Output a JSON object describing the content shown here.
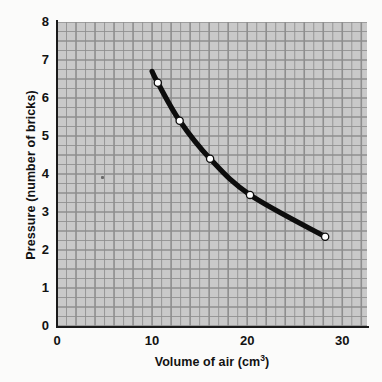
{
  "chart_data": {
    "type": "line",
    "title": "",
    "xlabel": "Volume of air (cm³)",
    "xlabel_main": "Volume of air (cm",
    "xlabel_sup": "3",
    "xlabel_tail": ")",
    "ylabel": "Pressure (number of bricks)",
    "xlim": [
      0,
      32.6
    ],
    "ylim": [
      0,
      8
    ],
    "xticks": [
      0,
      10,
      20,
      30
    ],
    "xtick_labels": [
      "0",
      "10",
      "20",
      "30"
    ],
    "yticks": [
      0,
      1,
      2,
      3,
      4,
      5,
      6,
      7,
      8
    ],
    "ytick_labels": [
      "0",
      "1",
      "2",
      "3",
      "4",
      "5",
      "6",
      "7",
      "8"
    ],
    "grid": true,
    "grid_minor_step_x": 1,
    "grid_minor_step_y": 0.25,
    "grid_major_step_x": 2,
    "grid_major_step_y": 0.5,
    "legend": null,
    "series": [
      {
        "name": "Pressure vs volume",
        "marker": "open-circle",
        "line_color": "#0d0d0d",
        "marker_face": "#ffffff",
        "x": [
          10.6,
          12.9,
          16.1,
          20.3,
          28.2
        ],
        "y": [
          6.4,
          5.4,
          4.4,
          3.45,
          2.35
        ]
      }
    ],
    "curve_extends_beyond_first_point": true,
    "curve_start": {
      "x": 10.0,
      "y": 6.7
    },
    "plot_background": "#c9c9c9",
    "grid_color": "#8e8e8e",
    "axis_color": "#1a1a1a"
  },
  "figure": {
    "background": "#fbfbfa"
  }
}
